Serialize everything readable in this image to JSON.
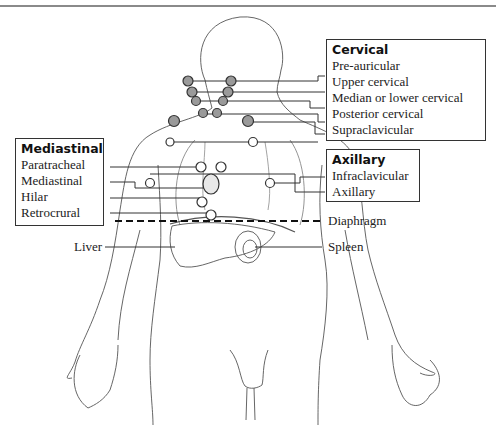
{
  "groups": {
    "cervical": {
      "title": "Cervical",
      "items": [
        "Pre-auricular",
        "Upper cervical",
        "Median or lower cervical",
        "Posterior cervical",
        "Supraclavicular"
      ]
    },
    "axillary": {
      "title": "Axillary",
      "items": [
        "Infraclavicular",
        "Axillary"
      ]
    },
    "mediastinal": {
      "title": "Mediastinal",
      "items": [
        "Paratracheal",
        "Mediastinal",
        "Hilar",
        "Retrocrural"
      ]
    }
  },
  "labels": {
    "diaphragm": "Diaphragm",
    "liver": "Liver",
    "spleen": "Spleen"
  },
  "colors": {
    "node_fill_cervical": "#9a9a9a",
    "node_fill_other": "#ffffff",
    "line": "#333333",
    "outline": "#555555"
  }
}
